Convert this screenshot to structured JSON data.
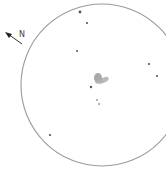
{
  "sketch": {
    "kind": "eyepiece sketch",
    "north_label": "N",
    "field_circle": {
      "cx": 102,
      "cy": 85,
      "r": 81,
      "stroke": "#9a9a9a"
    },
    "nebula": {
      "cx": 99,
      "cy": 79,
      "color": "#8c8c8c"
    },
    "stars": [
      {
        "x": 80,
        "y": 12,
        "r": 1.4
      },
      {
        "x": 87,
        "y": 23,
        "r": 1.1
      },
      {
        "x": 77,
        "y": 51,
        "r": 1.0
      },
      {
        "x": 149,
        "y": 64,
        "r": 1.1
      },
      {
        "x": 157,
        "y": 76,
        "r": 1.1
      },
      {
        "x": 91,
        "y": 87,
        "r": 1.2
      },
      {
        "x": 97,
        "y": 100,
        "r": 0.8
      },
      {
        "x": 99,
        "y": 104,
        "r": 0.8
      },
      {
        "x": 50,
        "y": 135,
        "r": 1.1
      }
    ]
  }
}
